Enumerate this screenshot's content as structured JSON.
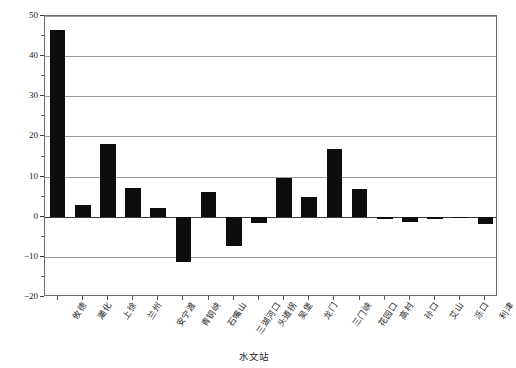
{
  "chart_data": {
    "type": "bar",
    "title": "",
    "xlabel": "水文站",
    "ylabel": "径流量比例/%",
    "ylim": [
      -20,
      50
    ],
    "yticks": [
      50,
      40,
      30,
      20,
      10,
      0,
      -10,
      -20
    ],
    "ytick_labels": [
      "50",
      "40",
      "30",
      "20",
      "10",
      "0",
      "−10",
      "−20"
    ],
    "grid": "horizontal",
    "legend": "none",
    "bar_color": "#0d0d0d",
    "categories": [
      "攸德",
      "潮化",
      "上徐",
      "兰州",
      "安宁渡",
      "青铜峡",
      "石嘴山",
      "三湖河口",
      "头道拐",
      "吴堡",
      "龙门",
      "三门峡",
      "花园口",
      "高村",
      "孙口",
      "艾山",
      "泺口",
      "利津"
    ],
    "values": [
      46.5,
      3.0,
      18.2,
      7.2,
      2.1,
      -11.3,
      6.1,
      -7.3,
      -1.5,
      9.7,
      4.8,
      16.8,
      6.9,
      -0.6,
      -1.4,
      -0.5,
      -0.3,
      -1.8
    ]
  },
  "axes": {
    "y_title": "径流量比例/%",
    "x_title": "水文站"
  }
}
